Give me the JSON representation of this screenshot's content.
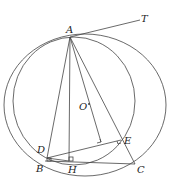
{
  "diagram": {
    "type": "geometry",
    "points": {
      "A": {
        "label": "A",
        "x": 70,
        "y": 37
      },
      "T": {
        "label": "T",
        "x": 143,
        "y": 19
      },
      "O": {
        "label": "O",
        "x": 88,
        "y": 105
      },
      "B": {
        "label": "B",
        "x": 45,
        "y": 160
      },
      "C": {
        "label": "C",
        "x": 135,
        "y": 164
      },
      "D": {
        "label": "D",
        "x": 47,
        "y": 157
      },
      "E": {
        "label": "E",
        "x": 121,
        "y": 140
      },
      "H": {
        "label": "H",
        "x": 69,
        "y": 161
      }
    },
    "segments": [
      "AT",
      "AB",
      "AH",
      "AC",
      "AE",
      "BC",
      "DE",
      "DH",
      "O-perpendicular-to-DE"
    ],
    "circles": [
      {
        "name": "circumcircle-ABC",
        "cx": 85,
        "cy": 105,
        "rx": 81,
        "ry": 71
      },
      {
        "name": "circle-ADE",
        "cx": 74,
        "cy": 101,
        "rx": 61,
        "ry": 64
      }
    ],
    "right_angle_marks": [
      "H",
      "D",
      "E",
      "foot-O-on-DE"
    ]
  }
}
